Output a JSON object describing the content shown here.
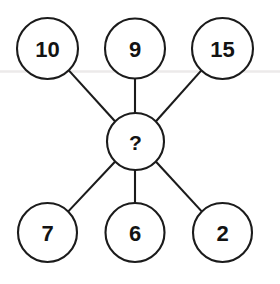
{
  "diagram": {
    "type": "spoke-hub-number-puzzle",
    "background_color": "#ffffff",
    "stroke_color": "#1b1b1b",
    "text_color": "#131313",
    "artifact_line_color": "#eceaea",
    "center": {
      "id": "center",
      "label": "?",
      "cx": 135.5,
      "cy": 141.5,
      "r": 28.5
    },
    "nodes": [
      {
        "id": "node-10",
        "label": "10",
        "cx": 47.5,
        "cy": 48.5,
        "r": 30.5
      },
      {
        "id": "node-9",
        "label": "9",
        "cx": 135.0,
        "cy": 48.5,
        "r": 30.0
      },
      {
        "id": "node-15",
        "label": "15",
        "cx": 222.5,
        "cy": 48.5,
        "r": 30.5
      },
      {
        "id": "node-7",
        "label": "7",
        "cx": 47.5,
        "cy": 232.5,
        "r": 29.5
      },
      {
        "id": "node-6",
        "label": "6",
        "cx": 135.0,
        "cy": 232.5,
        "r": 29.5
      },
      {
        "id": "node-2",
        "label": "2",
        "cx": 222.5,
        "cy": 232.5,
        "r": 29.5
      }
    ],
    "edges": [
      {
        "id": "edge-10-center",
        "from": "node-10",
        "to": "center",
        "x1": 68.8,
        "y1": 70.4,
        "x2": 115.9,
        "y2": 122.2
      },
      {
        "id": "edge-9-center",
        "from": "node-9",
        "to": "center",
        "x1": 135.0,
        "y1": 78.5,
        "x2": 135.0,
        "y2": 113.0
      },
      {
        "id": "edge-15-center",
        "from": "node-15",
        "to": "center",
        "x1": 201.4,
        "y1": 70.4,
        "x2": 155.1,
        "y2": 122.2
      },
      {
        "id": "edge-7-center",
        "from": "node-7",
        "to": "center",
        "x1": 68.3,
        "y1": 211.4,
        "x2": 115.9,
        "y2": 160.8
      },
      {
        "id": "edge-6-center",
        "from": "node-6",
        "to": "center",
        "x1": 135.0,
        "y1": 203.0,
        "x2": 135.0,
        "y2": 170.0
      },
      {
        "id": "edge-2-center",
        "from": "node-2",
        "to": "center",
        "x1": 201.7,
        "y1": 211.4,
        "x2": 155.1,
        "y2": 160.8
      }
    ],
    "artifact_line": {
      "x1": 0,
      "y1": 71.5,
      "x2": 280,
      "y2": 71.5
    }
  }
}
